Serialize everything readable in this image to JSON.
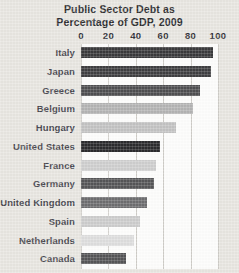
{
  "chart_data": {
    "type": "bar",
    "orientation": "horizontal",
    "title": "Public Sector Debt as Percentage of GDP, 2009",
    "title_lines": [
      "Public Sector Debt as",
      "Percentage of GDP, 2009"
    ],
    "xlabel": "",
    "ylabel": "",
    "xlim": [
      0,
      100
    ],
    "xticks": [
      0,
      20,
      40,
      60,
      80,
      100
    ],
    "xtick_labels": [
      "0",
      "20",
      "40",
      "60",
      "80",
      "100"
    ],
    "grid": true,
    "grid_axis": "x",
    "legend": "none",
    "categories": [
      "Italy",
      "Japan",
      "Greece",
      "Belgium",
      "Hungary",
      "United States",
      "France",
      "Germany",
      "United Kingdom",
      "Spain",
      "Netherlands",
      "Canada"
    ],
    "values": [
      96,
      95,
      87,
      82,
      69,
      58,
      55,
      53,
      48,
      43,
      39,
      33
    ],
    "bar_colors": [
      "#3a3a3c",
      "#3f3f41",
      "#4f4f51",
      "#b4b4b4",
      "#c3c3c3",
      "#2b2b2d",
      "#cfcfcf",
      "#565658",
      "#6e6e70",
      "#cdcdcd",
      "#dedede",
      "#555557"
    ]
  },
  "style": {
    "page_background": "#e8e6e1",
    "plot_background": "#fdfdfc",
    "gridline_color": "#cfcdc8",
    "title_color": "#2e2e30",
    "label_color": "#4a4a52",
    "tick_color": "#33333a"
  }
}
